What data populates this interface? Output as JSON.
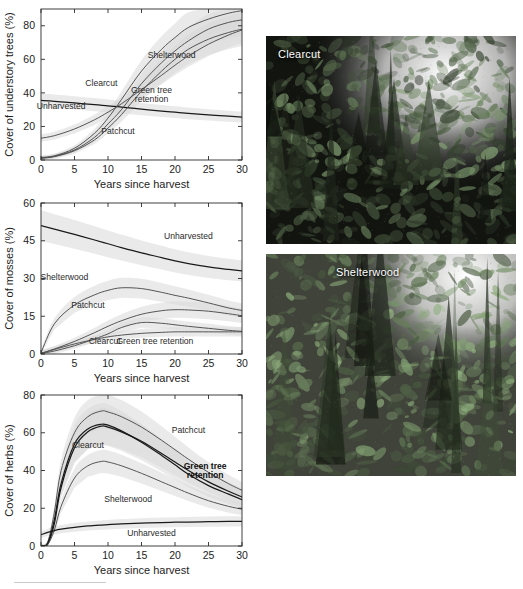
{
  "figure": {
    "panels": [
      "understory-trees",
      "mosses",
      "herbs"
    ]
  },
  "photos": [
    {
      "name": "clearcut-photo",
      "label": "Clearcut"
    },
    {
      "name": "shelterwood-photo",
      "label": "Shelterwood"
    }
  ],
  "colors": {
    "line": "#4d4d4d",
    "line_dark": "#1a1a1a",
    "band": "#d8d8d8",
    "axis": "#2b2b2b",
    "text": "#1d1d1d",
    "background": "#ffffff"
  },
  "chart_data": [
    {
      "type": "line",
      "name": "understory-trees",
      "title": "",
      "xlabel": "Years since harvest",
      "ylabel": "Cover of understory trees (%)",
      "xlim": [
        0,
        30
      ],
      "ylim": [
        0,
        90
      ],
      "xticks": [
        0,
        5,
        10,
        15,
        20,
        25,
        30
      ],
      "yticks": [
        0,
        20,
        40,
        60,
        80
      ],
      "grid": false,
      "legend": "inline-annotations",
      "x": [
        0,
        2,
        5,
        8,
        10,
        12,
        15,
        18,
        20,
        22,
        25,
        28,
        30
      ],
      "series": [
        {
          "name": "Unharvested",
          "label_x": 3.0,
          "label_y": 30.5,
          "values": [
            35.5,
            35.0,
            34.0,
            33.0,
            32.2,
            31.5,
            30.3,
            29.2,
            28.5,
            27.8,
            26.9,
            26.1,
            25.6
          ]
        },
        {
          "name": "Clearcut",
          "label_x": 9.0,
          "label_y": 44.0,
          "values": [
            1.5,
            2.5,
            7.0,
            16.0,
            25.0,
            36.0,
            53.0,
            66.0,
            73.0,
            79.0,
            84.0,
            87.5,
            89.0
          ]
        },
        {
          "name": "Patchcut",
          "label_x": 11.5,
          "label_y": 15.5,
          "values": [
            1.0,
            2.0,
            5.5,
            12.0,
            19.0,
            27.0,
            41.0,
            53.0,
            60.0,
            66.0,
            72.0,
            76.0,
            78.0
          ]
        },
        {
          "name": "Shelterwood",
          "label_x": 19.5,
          "label_y": 61.0,
          "values": [
            13.0,
            14.5,
            18.5,
            24.0,
            28.5,
            33.5,
            42.0,
            50.5,
            56.5,
            62.0,
            69.0,
            74.5,
            77.5
          ]
        },
        {
          "name": "Green tree retention",
          "label_x": 16.5,
          "label_y": 40.0,
          "values": [
            1.2,
            2.2,
            6.0,
            13.5,
            21.5,
            30.0,
            45.5,
            58.0,
            65.0,
            71.0,
            78.0,
            82.0,
            83.5
          ]
        }
      ]
    },
    {
      "type": "line",
      "name": "mosses",
      "title": "",
      "xlabel": "Years since harvest",
      "ylabel": "Cover of mosses (%)",
      "xlim": [
        0,
        30
      ],
      "ylim": [
        0,
        60
      ],
      "xticks": [
        0,
        5,
        10,
        15,
        20,
        25,
        30
      ],
      "yticks": [
        0,
        15,
        30,
        45,
        60
      ],
      "grid": false,
      "legend": "inline-annotations",
      "x": [
        0,
        2,
        5,
        8,
        10,
        12,
        15,
        18,
        20,
        22,
        25,
        28,
        30
      ],
      "series": [
        {
          "name": "Unharvested",
          "label_x": 22.0,
          "label_y": 45.5,
          "values": [
            51.0,
            49.6,
            47.5,
            45.3,
            43.8,
            42.3,
            40.2,
            38.3,
            37.0,
            35.9,
            34.6,
            33.6,
            33.0
          ]
        },
        {
          "name": "Shelterwood",
          "label_x": 3.5,
          "label_y": 29.5,
          "values": [
            0.5,
            12.0,
            19.5,
            23.5,
            25.3,
            26.3,
            26.0,
            24.5,
            23.3,
            22.2,
            20.3,
            18.3,
            17.3
          ]
        },
        {
          "name": "Patchcut",
          "label_x": 7.0,
          "label_y": 18.3,
          "values": [
            0.3,
            2.0,
            5.0,
            8.5,
            11.0,
            13.2,
            15.8,
            17.2,
            17.6,
            17.5,
            17.0,
            16.0,
            15.2
          ]
        },
        {
          "name": "Clearcut",
          "label_x": 9.5,
          "label_y": 3.8,
          "values": [
            0.2,
            1.2,
            3.3,
            6.0,
            8.0,
            10.5,
            12.5,
            12.2,
            11.6,
            11.0,
            10.2,
            9.4,
            9.0
          ]
        },
        {
          "name": "Green tree retention",
          "label_x": 17.0,
          "label_y": 3.8,
          "values": [
            0.2,
            1.8,
            4.0,
            5.8,
            6.8,
            7.5,
            8.2,
            8.6,
            8.8,
            8.8,
            8.8,
            8.8,
            8.8
          ]
        }
      ]
    },
    {
      "type": "line",
      "name": "herbs",
      "title": "",
      "xlabel": "Years since harvest",
      "ylabel": "Cover of herbs (%)",
      "xlim": [
        0,
        30
      ],
      "ylim": [
        0,
        80
      ],
      "xticks": [
        0,
        5,
        10,
        15,
        20,
        25,
        30
      ],
      "yticks": [
        0,
        20,
        40,
        60,
        80
      ],
      "grid": false,
      "legend": "inline-annotations",
      "x": [
        0,
        1,
        2,
        3,
        5,
        7,
        9,
        10,
        12,
        15,
        18,
        20,
        22,
        25,
        28,
        30
      ],
      "series": [
        {
          "name": "Patchcut",
          "label_x": 22.0,
          "label_y": 60.0,
          "values": [
            0.0,
            2.0,
            18.0,
            40.0,
            60.0,
            68.5,
            71.5,
            71.0,
            68.5,
            63.0,
            56.0,
            51.0,
            46.0,
            39.0,
            33.0,
            29.5
          ]
        },
        {
          "name": "Clearcut",
          "label_x": 7.0,
          "label_y": 52.0,
          "values": [
            0.0,
            1.0,
            12.0,
            31.0,
            52.0,
            60.5,
            63.5,
            63.0,
            60.5,
            55.5,
            49.0,
            44.5,
            40.0,
            34.0,
            29.0,
            26.0
          ]
        },
        {
          "name": "Green tree retention",
          "label_x": 24.5,
          "label_y": 41.0,
          "values": [
            0.0,
            1.5,
            14.0,
            33.0,
            54.0,
            62.0,
            64.5,
            64.0,
            61.0,
            55.0,
            48.0,
            43.0,
            38.0,
            32.0,
            27.5,
            24.5
          ]
        },
        {
          "name": "Shelterwood",
          "label_x": 13.0,
          "label_y": 23.5,
          "values": [
            0.0,
            0.8,
            8.5,
            21.0,
            36.0,
            42.5,
            44.8,
            44.5,
            42.5,
            38.5,
            34.0,
            31.0,
            28.0,
            24.0,
            21.0,
            19.5
          ]
        },
        {
          "name": "Unharvested",
          "label_x": 16.5,
          "label_y": 5.5,
          "values": [
            6.0,
            7.2,
            8.2,
            8.9,
            9.9,
            10.6,
            11.1,
            11.3,
            11.7,
            12.1,
            12.4,
            12.6,
            12.7,
            12.9,
            13.0,
            13.0
          ]
        }
      ]
    }
  ]
}
